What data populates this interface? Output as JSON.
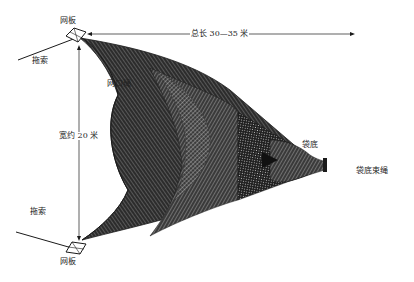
{
  "diagram": {
    "type": "trawl-net schematic",
    "colors": {
      "ink": "#1a1a1a",
      "mesh_dark": "#2a2a2a",
      "mesh_mid": "#555555",
      "background": "#ffffff"
    },
    "labels": {
      "otter_board_top": "网板",
      "otter_board_bottom": "网板",
      "warp_top": "拖索",
      "warp_bottom": "拖索",
      "headline": "网口绳",
      "total_length": "总长 30—35 米",
      "width": "宽约 20 米",
      "codend": "袋底",
      "codend_tie": "袋底束绳"
    },
    "dimensions": {
      "total_length_m": "30—35",
      "width_m": "20"
    }
  }
}
